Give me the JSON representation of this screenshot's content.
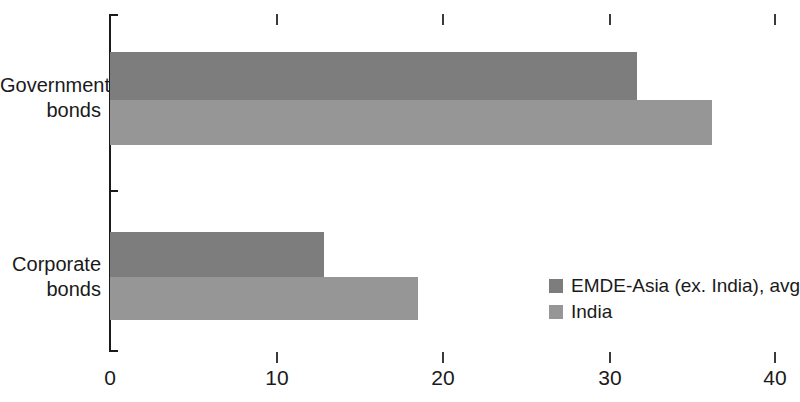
{
  "chart_data": {
    "type": "bar",
    "orientation": "horizontal",
    "title": "",
    "subtitle": "",
    "xlabel": "",
    "ylabel": "",
    "categories": [
      "Government bonds",
      "Corporate bonds"
    ],
    "category_lines": [
      [
        "Government",
        "bonds"
      ],
      [
        "Corporate",
        "bonds"
      ]
    ],
    "series": [
      {
        "name": "EMDE-Asia (ex. India), avg",
        "color": "#7d7d7d",
        "values": [
          31.7,
          12.9
        ]
      },
      {
        "name": "India",
        "color": "#969696",
        "values": [
          36.2,
          18.5
        ]
      }
    ],
    "xlim": [
      0,
      40
    ],
    "xticks": [
      0,
      10,
      20,
      30,
      40
    ],
    "xtick_labels": [
      "0",
      "10",
      "20",
      "30",
      "40"
    ],
    "grid": false,
    "legend_position": "inside-right-lower",
    "top_axis_ticks": true
  },
  "axis": {
    "tick_labels": [
      "0",
      "10",
      "20",
      "30",
      "40"
    ]
  },
  "legend": {
    "items": [
      {
        "label": "EMDE-Asia (ex. India), avg",
        "color": "#7d7d7d"
      },
      {
        "label": "India",
        "color": "#969696"
      }
    ]
  },
  "categories": [
    {
      "line1": "Government",
      "line2": "bonds"
    },
    {
      "line1": "Corporate",
      "line2": "bonds"
    }
  ],
  "colors": {
    "series_1": "#7d7d7d",
    "series_2": "#969696",
    "axis": "#1a1a1a",
    "background": "#ffffff"
  }
}
